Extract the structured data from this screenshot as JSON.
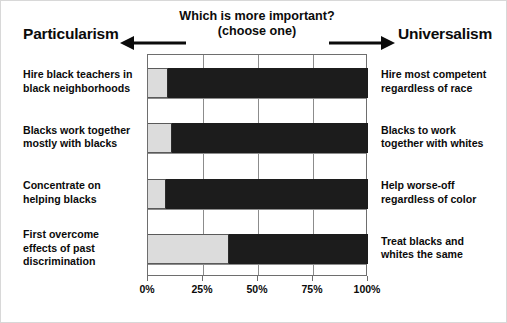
{
  "header": {
    "pole_left": "Particularism",
    "pole_right": "Universalism",
    "question_line1": "Which is more important?",
    "question_line2": "(choose one)",
    "arrow_left_icon": "arrow-left-icon",
    "arrow_right_icon": "arrow-right-icon"
  },
  "axis": {
    "tick_labels": [
      "0%",
      "25%",
      "50%",
      "75%",
      "100%"
    ],
    "tick_values": [
      0,
      25,
      50,
      75,
      100
    ]
  },
  "rows": [
    {
      "left_label": "Hire black teachers in\nblack neighborhoods",
      "right_label": "Hire most competent\nregardless of race",
      "particularism": 9,
      "universalism": 91
    },
    {
      "left_label": "Blacks work together\nmostly with blacks",
      "right_label": "Blacks to work\ntogether with whites",
      "particularism": 11,
      "universalism": 89
    },
    {
      "left_label": "Concentrate on\nhelping blacks",
      "right_label": "Help worse-off\nregardless of color",
      "particularism": 8,
      "universalism": 92
    },
    {
      "left_label": "First overcome\neffects of past\ndiscrimination",
      "right_label": "Treat blacks and\nwhites the same",
      "particularism": 37,
      "universalism": 63
    }
  ],
  "colors": {
    "particularism_fill": "#dcdcdc",
    "universalism_fill": "#1c1c1c",
    "axis_line": "#6e6e6e",
    "text": "#0b0b0b",
    "background": "#ffffff"
  },
  "chart_data": {
    "type": "bar",
    "orientation": "horizontal",
    "stacked": true,
    "title": "Which is more important? (choose one)",
    "xlabel": "",
    "ylabel": "",
    "xlim": [
      0,
      100
    ],
    "xticks": [
      0,
      25,
      50,
      75,
      100
    ],
    "xticklabels": [
      "0%",
      "25%",
      "50%",
      "75%",
      "100%"
    ],
    "grid": true,
    "legend": "none",
    "categories": [
      "Hire black teachers in black neighborhoods / Hire most competent regardless of race",
      "Blacks work together mostly with blacks / Blacks to work together with whites",
      "Concentrate on helping blacks / Help worse-off regardless of color",
      "First overcome effects of past discrimination / Treat blacks and whites the same"
    ],
    "series": [
      {
        "name": "Particularism",
        "color": "#dcdcdc",
        "values": [
          9,
          11,
          8,
          37
        ]
      },
      {
        "name": "Universalism",
        "color": "#1c1c1c",
        "values": [
          91,
          89,
          92,
          63
        ]
      }
    ],
    "annotations": [
      "Particularism",
      "Universalism",
      "Which is more important?",
      "(choose one)"
    ]
  }
}
